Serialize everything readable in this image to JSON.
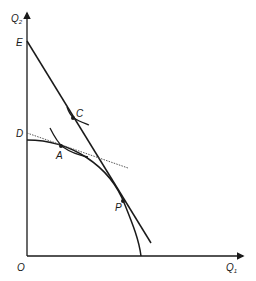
{
  "diagram": {
    "type": "economics-ppf-diagram",
    "axes": {
      "y_label": "Q",
      "y_label_sub": "2",
      "x_label": "Q",
      "x_label_sub": "1",
      "origin_label": "O"
    },
    "points": {
      "E": "E",
      "D": "D",
      "C": "C",
      "A": "A",
      "P": "P"
    },
    "elements": [
      {
        "name": "production-possibility-frontier",
        "kind": "concave curve from D to Q1 axis"
      },
      {
        "name": "price-line-EP",
        "kind": "straight line from E through C and P"
      },
      {
        "name": "domestic-price-line-DA",
        "kind": "dotted tangent line at A"
      },
      {
        "name": "indifference-curve-A",
        "kind": "short convex curve through A"
      },
      {
        "name": "indifference-curve-C",
        "kind": "short convex curve through C"
      }
    ],
    "colors": {
      "line": "#1a1a1a",
      "dotted": "#555555",
      "background": "#ffffff"
    }
  }
}
